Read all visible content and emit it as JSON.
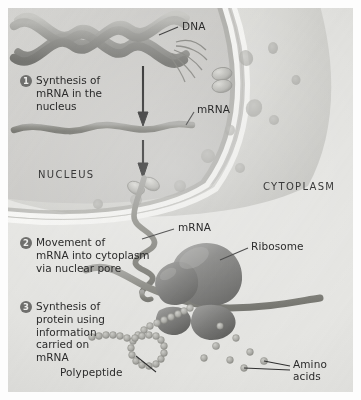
{
  "figure": {
    "background_color": "#e9e9e7",
    "ink_color": "#2b2b2b"
  },
  "compartments": [
    {
      "name": "nucleus-label",
      "text": "NUCLEUS"
    },
    {
      "name": "cytoplasm-label",
      "text": "CYTOPLASM"
    }
  ],
  "steps": [
    {
      "number": "1",
      "text": "Synthesis of\nmRNA in the\nnucleus"
    },
    {
      "number": "2",
      "text": "Movement of\nmRNA into cytoplasm\nvia nuclear pore"
    },
    {
      "number": "3",
      "text": "Synthesis of\nprotein using\ninformation\ncarried on\nmRNA"
    }
  ],
  "callouts": [
    {
      "name": "dna",
      "text": "DNA"
    },
    {
      "name": "mrna-nucleus",
      "text": "mRNA"
    },
    {
      "name": "mrna-cytoplasm",
      "text": "mRNA"
    },
    {
      "name": "ribosome",
      "text": "Ribosome"
    },
    {
      "name": "polypeptide",
      "text": "Polypeptide"
    },
    {
      "name": "amino-acids",
      "text": "Amino\nacids"
    }
  ],
  "colors": {
    "membrane_light": "#f7f7f5",
    "membrane_line": "#8d8d8a",
    "nucleoplasm": "#cfcfcc",
    "cytoplasm": "#e4e4e1",
    "strand": "#8a8a86",
    "ribosome_dark": "#6d6d6b",
    "ribosome_mid": "#8a8a88",
    "bead": "#a9a9a5",
    "arrow": "#232323"
  },
  "structures": {
    "dna_helix": "double helix ribbon, 3 turns, top-left",
    "nuclear_pore_upper": "two stacked ovals on membrane",
    "nuclear_pore_lower": "two stacked ovals on membrane with mRNA threading through",
    "ribosome": "two-lobed dark gray organelle",
    "polypeptide": "beaded chain forming a loop",
    "amino_acids": "scattered small circles",
    "arrows": 2
  }
}
